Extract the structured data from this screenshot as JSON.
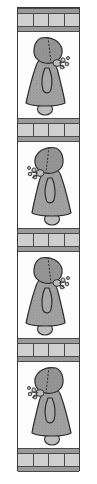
{
  "artwork": {
    "title": "Sunbonnet Sue Quilt Strip",
    "orientation": "vertical",
    "background_color": "#ffffff",
    "panel": {
      "border_color": "#3a3a3a",
      "background_color": "#fdfdfd",
      "left": 17,
      "top": 7,
      "width": 63,
      "height": 464
    },
    "palette": {
      "sash_rail": "#9a9a9a",
      "sash_cell": "#cfcfcf",
      "seam_line": "#4a4a4a",
      "dress_fill": "#a0a0a0",
      "bonnet_fill": "#8e8e8e",
      "outline": "#2e2e2e",
      "shoe_fill": "#b5b5b5",
      "hand_fill": "#bdbdbd"
    }
  },
  "sashing": {
    "cell_count": 4,
    "band_height": 24,
    "rail_height": 6,
    "cells": [
      "cell-1",
      "cell-2",
      "cell-3",
      "cell-4"
    ]
  },
  "rows": [
    {
      "kind": "sashing",
      "index": 1,
      "label": "sashing-band-1"
    },
    {
      "kind": "block",
      "index": 1,
      "label": "sunbonnet-block-1",
      "facing": "right",
      "mirrored": false
    },
    {
      "kind": "sashing",
      "index": 2,
      "label": "sashing-band-2"
    },
    {
      "kind": "block",
      "index": 2,
      "label": "sunbonnet-block-2",
      "facing": "left",
      "mirrored": true
    },
    {
      "kind": "sashing",
      "index": 3,
      "label": "sashing-band-3"
    },
    {
      "kind": "block",
      "index": 3,
      "label": "sunbonnet-block-3",
      "facing": "right",
      "mirrored": false
    },
    {
      "kind": "sashing",
      "index": 4,
      "label": "sashing-band-4"
    },
    {
      "kind": "block",
      "index": 4,
      "label": "sunbonnet-block-4",
      "facing": "left",
      "mirrored": true
    },
    {
      "kind": "sashing",
      "index": 5,
      "label": "sashing-band-5"
    }
  ],
  "block_parts": {
    "bonnet": "bonnet",
    "dress": "dress",
    "arm": "arm",
    "hand": "hand",
    "flowers": "flowers",
    "shoe": "shoe"
  }
}
